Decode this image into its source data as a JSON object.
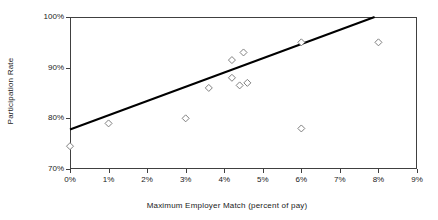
{
  "figure": {
    "background_color": "#ffffff",
    "text_color": "#1a1a1a"
  },
  "chart_data": {
    "type": "scatter",
    "title": "",
    "xlabel": "Maximum Employer Match (percent of pay)",
    "ylabel": "Participation Rate",
    "xlim": [
      0,
      9
    ],
    "ylim": [
      70,
      100
    ],
    "x_tick_labels": [
      "0%",
      "1%",
      "2%",
      "3%",
      "4%",
      "5%",
      "6%",
      "7%",
      "8%",
      "9%"
    ],
    "y_tick_labels_top_to_bottom": [
      "100%",
      "90%",
      "80%",
      "70%"
    ],
    "grid": false,
    "legend": false,
    "points": [
      {
        "x": 0,
        "y": 74.5
      },
      {
        "x": 1,
        "y": 79
      },
      {
        "x": 3,
        "y": 80
      },
      {
        "x": 3.6,
        "y": 86
      },
      {
        "x": 4.2,
        "y": 88
      },
      {
        "x": 4.2,
        "y": 91.5
      },
      {
        "x": 4.4,
        "y": 86.5
      },
      {
        "x": 4.5,
        "y": 93
      },
      {
        "x": 4.6,
        "y": 87
      },
      {
        "x": 6,
        "y": 78
      },
      {
        "x": 6,
        "y": 95
      },
      {
        "x": 8,
        "y": 95
      }
    ],
    "trendline": {
      "x1": 0,
      "y1": 77.8,
      "x2": 7.9,
      "y2": 100
    },
    "style": {
      "marker_shape": "diamond",
      "marker_fill": "#ffffff",
      "marker_stroke": "#808080",
      "marker_size": 7,
      "trendline_color": "#000000",
      "trendline_width": 2,
      "frame_color": "#404040"
    }
  }
}
